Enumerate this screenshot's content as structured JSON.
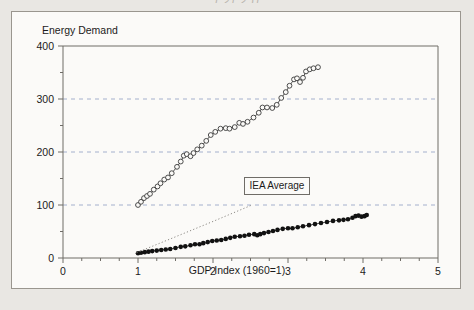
{
  "page": {
    "top_remnant_text": "1,21 2,)1"
  },
  "figure": {
    "y_axis_title": "Energy Demand",
    "x_axis_title": "GDP Index (1960=1)",
    "annotation_label": "IEA Average",
    "frame_color": "#6f6c67",
    "grid_color": "#9aa8c8",
    "background_color": "#fbfaf8",
    "page_background_color": "#e9e7e3"
  },
  "chart_data": {
    "type": "scatter",
    "title": "",
    "xlabel": "GDP Index (1960=1)",
    "ylabel": "Energy Demand",
    "xlim": [
      0,
      5
    ],
    "ylim": [
      0,
      400
    ],
    "x_ticks": [
      0,
      1,
      2,
      3,
      4,
      5
    ],
    "y_ticks": [
      0,
      100,
      200,
      300,
      400
    ],
    "x_minor_ticks": [
      0.25,
      0.5,
      0.75,
      1.25,
      1.5,
      1.75,
      2.25,
      2.5,
      2.75,
      3.25,
      3.5,
      3.75,
      4.25,
      4.5,
      4.75
    ],
    "y_minor_ticks": [
      50,
      150,
      250,
      350
    ],
    "grid": "horizontal-dashed at 100, 200, 300",
    "legend": "none",
    "annotations": [
      {
        "text": "IEA Average",
        "x": 2.62,
        "y": 137,
        "points_to_series": "iea-average-trend"
      }
    ],
    "series": [
      {
        "name": "upper-series",
        "marker": "open-circle",
        "line": "solid",
        "points": [
          [
            1.0,
            100
          ],
          [
            1.04,
            106
          ],
          [
            1.08,
            113
          ],
          [
            1.12,
            117
          ],
          [
            1.16,
            121
          ],
          [
            1.21,
            129
          ],
          [
            1.26,
            135
          ],
          [
            1.3,
            141
          ],
          [
            1.35,
            148
          ],
          [
            1.4,
            152
          ],
          [
            1.45,
            160
          ],
          [
            1.52,
            172
          ],
          [
            1.57,
            182
          ],
          [
            1.61,
            193
          ],
          [
            1.65,
            196
          ],
          [
            1.7,
            192
          ],
          [
            1.74,
            198
          ],
          [
            1.79,
            205
          ],
          [
            1.85,
            212
          ],
          [
            1.91,
            221
          ],
          [
            1.97,
            232
          ],
          [
            2.03,
            238
          ],
          [
            2.1,
            244
          ],
          [
            2.17,
            245
          ],
          [
            2.22,
            244
          ],
          [
            2.29,
            247
          ],
          [
            2.35,
            255
          ],
          [
            2.4,
            253
          ],
          [
            2.46,
            257
          ],
          [
            2.54,
            265
          ],
          [
            2.61,
            274
          ],
          [
            2.66,
            284
          ],
          [
            2.72,
            284
          ],
          [
            2.79,
            283
          ],
          [
            2.85,
            289
          ],
          [
            2.91,
            302
          ],
          [
            2.97,
            313
          ],
          [
            3.02,
            325
          ],
          [
            3.08,
            337
          ],
          [
            3.12,
            339
          ],
          [
            3.16,
            332
          ],
          [
            3.2,
            340
          ],
          [
            3.24,
            352
          ],
          [
            3.29,
            356
          ],
          [
            3.34,
            358
          ],
          [
            3.4,
            360
          ]
        ]
      },
      {
        "name": "lower-series",
        "marker": "filled-circle",
        "line": "solid",
        "points": [
          [
            1.0,
            9
          ],
          [
            1.04,
            10
          ],
          [
            1.09,
            11
          ],
          [
            1.14,
            12
          ],
          [
            1.19,
            13
          ],
          [
            1.25,
            14
          ],
          [
            1.31,
            15
          ],
          [
            1.37,
            16
          ],
          [
            1.43,
            17
          ],
          [
            1.5,
            19
          ],
          [
            1.57,
            21
          ],
          [
            1.63,
            22
          ],
          [
            1.7,
            24
          ],
          [
            1.76,
            26
          ],
          [
            1.82,
            26
          ],
          [
            1.87,
            28
          ],
          [
            1.93,
            30
          ],
          [
            1.99,
            32
          ],
          [
            2.05,
            33
          ],
          [
            2.11,
            34
          ],
          [
            2.17,
            36
          ],
          [
            2.23,
            38
          ],
          [
            2.29,
            40
          ],
          [
            2.36,
            41
          ],
          [
            2.42,
            42
          ],
          [
            2.48,
            44
          ],
          [
            2.55,
            45
          ],
          [
            2.59,
            43
          ],
          [
            2.63,
            45
          ],
          [
            2.68,
            47
          ],
          [
            2.74,
            49
          ],
          [
            2.8,
            51
          ],
          [
            2.86,
            53
          ],
          [
            2.93,
            55
          ],
          [
            3.0,
            56
          ],
          [
            3.06,
            56
          ],
          [
            3.13,
            58
          ],
          [
            3.2,
            60
          ],
          [
            3.28,
            62
          ],
          [
            3.36,
            64
          ],
          [
            3.44,
            66
          ],
          [
            3.52,
            68
          ],
          [
            3.6,
            70
          ],
          [
            3.68,
            71
          ],
          [
            3.74,
            72
          ],
          [
            3.8,
            73
          ],
          [
            3.86,
            76
          ],
          [
            3.9,
            79
          ],
          [
            3.94,
            80
          ],
          [
            3.98,
            78
          ],
          [
            4.02,
            79
          ],
          [
            4.05,
            81
          ]
        ]
      },
      {
        "name": "iea-average-trend",
        "marker": "none",
        "line": "dotted",
        "points": [
          [
            0.98,
            10
          ],
          [
            1.5,
            40
          ],
          [
            2.0,
            69
          ],
          [
            2.52,
            100
          ]
        ]
      }
    ]
  }
}
